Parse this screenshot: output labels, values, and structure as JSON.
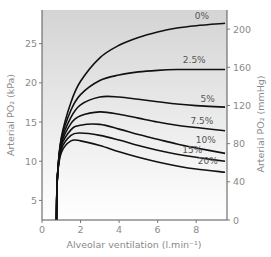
{
  "chart_data": {
    "type": "line",
    "title": "",
    "xlabel": "Alveolar ventilation (l.min⁻¹)",
    "ylabel_left": "Arterial PO₂ (kPa)",
    "ylabel_right": "Arterial PO₂ (mmHg)",
    "xlim": [
      0,
      9.6
    ],
    "ylim_left": [
      2.5,
      29.3
    ],
    "ylim_right": [
      0,
      220
    ],
    "x_ticks": [
      0,
      2,
      4,
      6,
      8
    ],
    "y_ticks_left": [
      5,
      10,
      15,
      20,
      25
    ],
    "y_ticks_right": [
      0,
      40,
      80,
      120,
      160,
      200
    ],
    "grid": false,
    "background": "gradient grey (top) to white (bottom)",
    "series": [
      {
        "name": "0%",
        "label": "0%",
        "x": [
          0.75,
          0.8,
          1.0,
          1.5,
          2,
          3,
          4,
          5,
          6,
          7,
          8,
          9.5
        ],
        "y": [
          2.5,
          8,
          13,
          17.5,
          20.2,
          23.2,
          24.8,
          25.8,
          26.5,
          27.0,
          27.3,
          27.6
        ]
      },
      {
        "name": "2.5%",
        "label": "2.5%",
        "x": [
          0.75,
          0.8,
          1.0,
          1.5,
          2,
          3,
          4,
          5,
          6,
          7,
          8,
          9.5
        ],
        "y": [
          2.5,
          8,
          12.8,
          16.5,
          18.5,
          20.3,
          21.0,
          21.4,
          21.6,
          21.7,
          21.7,
          21.7
        ]
      },
      {
        "name": "5%",
        "label": "5%",
        "x": [
          0.75,
          0.8,
          1.0,
          1.5,
          2,
          3,
          4,
          5,
          6,
          7,
          8,
          9.5
        ],
        "y": [
          2.5,
          8,
          12.5,
          15.6,
          17.2,
          18.2,
          18.2,
          17.9,
          17.6,
          17.3,
          17.1,
          16.9
        ]
      },
      {
        "name": "7.5%",
        "label": "7.5%",
        "x": [
          0.75,
          0.8,
          1.0,
          1.5,
          2,
          3,
          4,
          5,
          6,
          7,
          8,
          9.5
        ],
        "y": [
          2.5,
          8,
          12.2,
          14.8,
          15.8,
          16.3,
          16.0,
          15.5,
          15.0,
          14.6,
          14.3,
          13.9
        ]
      },
      {
        "name": "10%",
        "label": "10%",
        "x": [
          0.75,
          0.8,
          1.0,
          1.5,
          2,
          3,
          4,
          5,
          6,
          7,
          8,
          9.5
        ],
        "y": [
          2.5,
          8,
          11.9,
          14.0,
          14.6,
          14.7,
          14.1,
          13.4,
          12.8,
          12.2,
          11.7,
          11.0
        ]
      },
      {
        "name": "15%",
        "label": "15%",
        "x": [
          0.75,
          0.8,
          1.0,
          1.5,
          2,
          3,
          4,
          5,
          6,
          7,
          8,
          9.5
        ],
        "y": [
          2.5,
          8,
          11.5,
          13.3,
          13.6,
          13.3,
          12.7,
          12.0,
          11.4,
          10.9,
          10.5,
          10.0
        ]
      },
      {
        "name": "20%",
        "label": "20%",
        "x": [
          0.75,
          0.8,
          1.0,
          1.5,
          2,
          3,
          4,
          5,
          6,
          7,
          8,
          9.5
        ],
        "y": [
          2.5,
          8,
          11.1,
          12.6,
          12.6,
          12.0,
          11.2,
          10.5,
          9.9,
          9.4,
          9.0,
          8.6
        ]
      }
    ],
    "annotations": [
      {
        "text": "0%",
        "x": 8.3,
        "y": 28.1
      },
      {
        "text": "2.5%",
        "x": 7.9,
        "y": 22.5
      },
      {
        "text": "5%",
        "x": 8.6,
        "y": 17.6
      },
      {
        "text": "7.5%",
        "x": 8.3,
        "y": 14.8
      },
      {
        "text": "10%",
        "x": 8.5,
        "y": 12.3
      },
      {
        "text": "15%",
        "x": 7.8,
        "y": 11.0
      },
      {
        "text": "20%",
        "x": 8.6,
        "y": 9.6
      }
    ]
  }
}
